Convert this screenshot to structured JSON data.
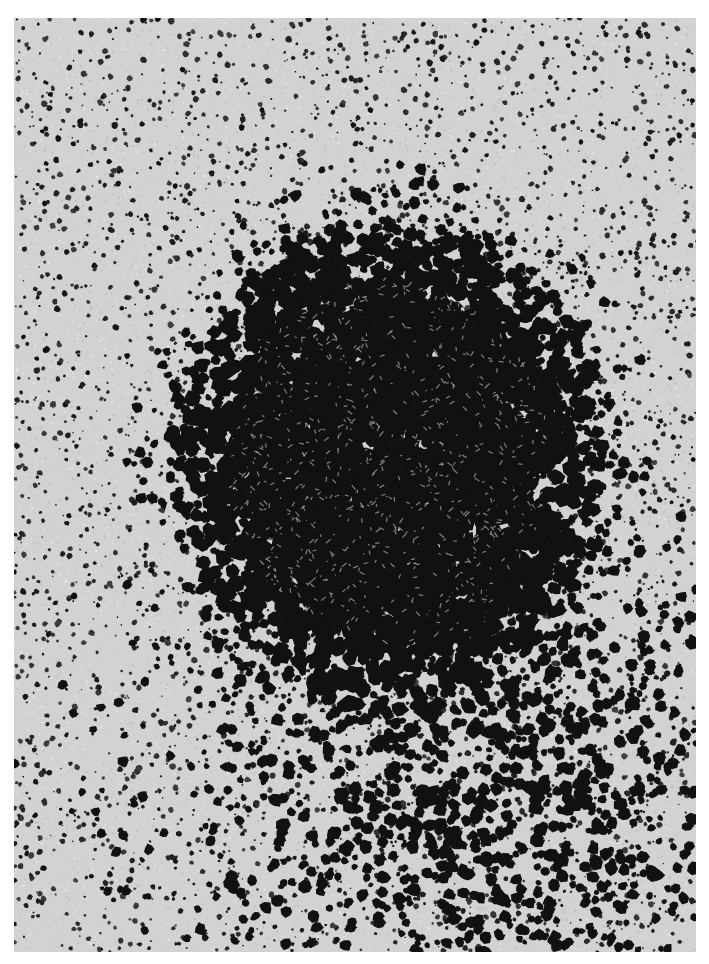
{
  "image": {
    "subject": "micrograph-dark-grain-cluster",
    "page_background": "#ffffff",
    "frame": {
      "x": 14,
      "y": 18,
      "width": 682,
      "height": 934
    },
    "background_gray": "#d2d2d2",
    "grain_color": "#111111",
    "cluster": {
      "cx": 375,
      "cy": 440,
      "rx": 240,
      "ry": 270
    },
    "scatter_density": 0.0065,
    "core_density": 0.03,
    "seed": 1337
  }
}
